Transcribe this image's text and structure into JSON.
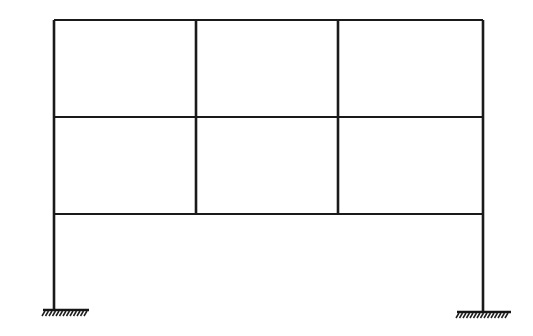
{
  "figure": {
    "title": "Two-storey three-bay rigid plane frame on fixed supports",
    "type": "structural-frame-elevation",
    "caption": "",
    "background_color": "#ffffff",
    "line_color": "#1a1a1a",
    "canvas": {
      "width": 533,
      "height": 336
    }
  },
  "geometry": {
    "column_x_positions": [
      54,
      196,
      338,
      483
    ],
    "beam_y_positions": [
      20,
      117,
      214
    ],
    "ground_y_positions": [
      310,
      312
    ],
    "exterior_column_top_y": 20,
    "interior_column_top_y": 20,
    "interior_column_bottom_y": 214,
    "exterior_column_bottom_y_left": 310,
    "exterior_column_bottom_y_right": 312
  },
  "members": {
    "columns": [
      {
        "name": "left-exterior-column",
        "x": 54,
        "y_top": 20,
        "y_bottom": 310
      },
      {
        "name": "interior-column-1",
        "x": 196,
        "y_top": 20,
        "y_bottom": 214
      },
      {
        "name": "interior-column-2",
        "x": 338,
        "y_top": 20,
        "y_bottom": 214
      },
      {
        "name": "right-exterior-column",
        "x": 483,
        "y_top": 20,
        "y_bottom": 312
      }
    ],
    "beams": [
      {
        "name": "roof-beam",
        "y": 20,
        "x_start": 54,
        "x_end": 483
      },
      {
        "name": "second-floor-beam",
        "y": 117,
        "x_start": 54,
        "x_end": 483
      },
      {
        "name": "first-floor-beam",
        "y": 214,
        "x_start": 54,
        "x_end": 483
      }
    ]
  },
  "bays": {
    "count": 3,
    "labels": [
      "left-bay",
      "centre-bay",
      "right-bay"
    ],
    "widths": [
      142,
      142,
      145
    ]
  },
  "storeys": {
    "count": 2,
    "labels": [
      "upper-storey",
      "lower-storey"
    ],
    "heights": [
      97,
      97
    ],
    "ground_storey_height": 96
  },
  "supports": [
    {
      "name": "left-fixed-support",
      "column": "left-exterior-column",
      "x": 54,
      "y": 310,
      "hatch_x_start": 43,
      "hatch_x_end": 89,
      "hatch_count": 13,
      "symbol": "fixed-support-ground-hatch"
    },
    {
      "name": "right-fixed-support",
      "column": "right-exterior-column",
      "x": 483,
      "y": 312,
      "hatch_x_start": 457,
      "hatch_x_end": 511,
      "hatch_count": 15,
      "symbol": "fixed-support-ground-hatch"
    }
  ],
  "joints": [
    {
      "name": "joint-roof-left",
      "x": 54,
      "y": 20
    },
    {
      "name": "joint-roof-mid-1",
      "x": 196,
      "y": 20
    },
    {
      "name": "joint-roof-mid-2",
      "x": 338,
      "y": 20
    },
    {
      "name": "joint-roof-right",
      "x": 483,
      "y": 20
    },
    {
      "name": "joint-level2-left",
      "x": 54,
      "y": 117
    },
    {
      "name": "joint-level2-mid-1",
      "x": 196,
      "y": 117
    },
    {
      "name": "joint-level2-mid-2",
      "x": 338,
      "y": 117
    },
    {
      "name": "joint-level2-right",
      "x": 483,
      "y": 117
    },
    {
      "name": "joint-level1-left",
      "x": 54,
      "y": 214
    },
    {
      "name": "joint-level1-mid-1",
      "x": 196,
      "y": 214
    },
    {
      "name": "joint-level1-mid-2",
      "x": 338,
      "y": 214
    },
    {
      "name": "joint-level1-right",
      "x": 483,
      "y": 214
    }
  ],
  "annotations": {
    "labels": [],
    "dimensions": [],
    "loads": []
  }
}
